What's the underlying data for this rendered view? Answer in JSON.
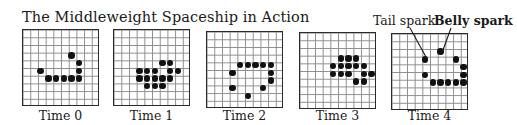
{
  "title": "The Middleweight Spaceship in Action",
  "grid_size": 10,
  "panels": [
    {
      "label": "Time 0",
      "left": 22,
      "top": 29,
      "cells": [
        [
          6,
          3
        ],
        [
          7,
          4
        ],
        [
          2,
          5
        ],
        [
          7,
          5
        ],
        [
          3,
          6
        ],
        [
          4,
          6
        ],
        [
          5,
          6
        ],
        [
          6,
          6
        ],
        [
          7,
          6
        ]
      ]
    },
    {
      "label": "Time 1",
      "left": 113,
      "top": 29,
      "cells": [
        [
          6,
          4
        ],
        [
          7,
          4
        ],
        [
          3,
          5
        ],
        [
          4,
          5
        ],
        [
          5,
          5
        ],
        [
          7,
          5
        ],
        [
          8,
          5
        ],
        [
          3,
          6
        ],
        [
          4,
          6
        ],
        [
          5,
          6
        ],
        [
          6,
          6
        ],
        [
          7,
          6
        ],
        [
          4,
          7
        ],
        [
          5,
          7
        ],
        [
          6,
          7
        ]
      ]
    },
    {
      "label": "Time 2",
      "left": 206,
      "top": 31,
      "cells": [
        [
          4,
          4
        ],
        [
          5,
          4
        ],
        [
          6,
          4
        ],
        [
          7,
          4
        ],
        [
          8,
          4
        ],
        [
          3,
          5
        ],
        [
          8,
          5
        ],
        [
          8,
          6
        ],
        [
          3,
          7
        ],
        [
          7,
          7
        ],
        [
          5,
          8
        ]
      ]
    },
    {
      "label": "Time 3",
      "left": 299,
      "top": 32,
      "cells": [
        [
          5,
          3
        ],
        [
          6,
          3
        ],
        [
          7,
          3
        ],
        [
          4,
          4
        ],
        [
          5,
          4
        ],
        [
          6,
          4
        ],
        [
          7,
          4
        ],
        [
          8,
          4
        ],
        [
          4,
          5
        ],
        [
          5,
          5
        ],
        [
          6,
          5
        ],
        [
          8,
          5
        ],
        [
          9,
          5
        ],
        [
          7,
          6
        ],
        [
          8,
          6
        ]
      ]
    },
    {
      "label": "Time 4",
      "left": 391,
      "top": 33,
      "cells": [
        [
          6,
          2
        ],
        [
          4,
          3
        ],
        [
          8,
          3
        ],
        [
          9,
          4
        ],
        [
          4,
          5
        ],
        [
          9,
          5
        ],
        [
          5,
          6
        ],
        [
          6,
          6
        ],
        [
          7,
          6
        ],
        [
          8,
          6
        ],
        [
          9,
          6
        ]
      ]
    }
  ],
  "annotations": {
    "tail_spark": "Tail spark",
    "belly_spark": "Belly spark"
  },
  "colors": {
    "ink": "#111111",
    "grid_line": "#8d8d8d",
    "background": "#ffffff"
  }
}
